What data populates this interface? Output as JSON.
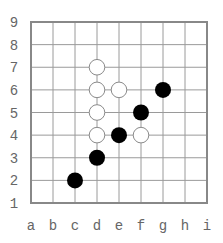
{
  "board": {
    "columns": [
      "a",
      "b",
      "c",
      "d",
      "e",
      "f",
      "g",
      "h",
      "i"
    ],
    "rows": [
      "1",
      "2",
      "3",
      "4",
      "5",
      "6",
      "7",
      "8",
      "9"
    ],
    "colors": {
      "grid_line": "#9a9a9a",
      "border": "#888888",
      "label": "#666666",
      "black_stone": "#000000",
      "white_stone_fill": "#ffffff",
      "white_stone_stroke": "#8a8a8a",
      "background": "#ffffff"
    }
  },
  "stones": {
    "white": [
      "d7",
      "d6",
      "e6",
      "d5",
      "d4",
      "f4"
    ],
    "black": [
      "c2",
      "d3",
      "e4",
      "f5",
      "g6"
    ]
  }
}
